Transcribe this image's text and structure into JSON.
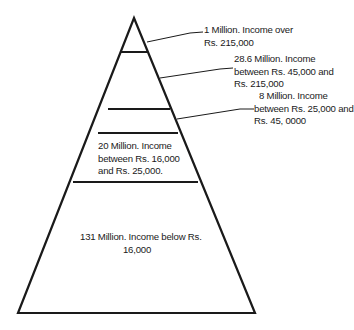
{
  "diagram": {
    "type": "income-pyramid",
    "levels": [
      {
        "id": "top",
        "population": "1 Million",
        "lines": [
          "1 Million. Income over",
          "Rs. 215,000"
        ]
      },
      {
        "id": "level2",
        "population": "28.6 Million",
        "lines": [
          "28.6 Million. Income",
          "between Rs. 45,000 and",
          "Rs. 215,000"
        ]
      },
      {
        "id": "level3",
        "population": "8 Million",
        "lines": [
          "8 Million. Income",
          "between Rs. 25,000 and",
          "Rs. 45, 0000"
        ]
      },
      {
        "id": "level4",
        "population": "20 Million",
        "lines": [
          "20 Million. Income",
          "between Rs. 16,000",
          "and Rs. 25,000."
        ]
      },
      {
        "id": "base",
        "population": "131 Million",
        "lines": [
          "131 Million. Income below Rs.",
          "16,000"
        ]
      }
    ],
    "colors": {
      "stroke": "#1a1a1a",
      "fill": "#ffffff"
    }
  }
}
